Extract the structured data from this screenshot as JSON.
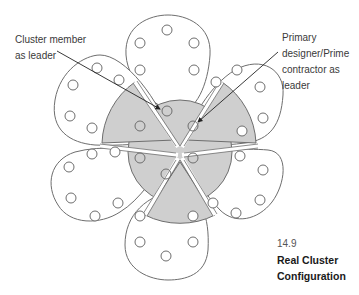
{
  "figure": {
    "number": "14.9",
    "title_line1": "Real Cluster",
    "title_line2": "Configuration"
  },
  "annotations": {
    "left": {
      "line1": "Cluster member",
      "line2": "as leader"
    },
    "right": {
      "line1": "Primary",
      "line2": "designer/Prime",
      "line3": "contractor as",
      "line4": "leader"
    }
  },
  "colors": {
    "stroke": "#6e6e6e",
    "shade": "#cfcfcf",
    "background": "#ffffff",
    "text": "#3a3a3a"
  },
  "diagram": {
    "center": [
      180,
      150
    ],
    "core_radius": 52,
    "petal_count": 6,
    "shaded_sectors": [
      "top-left",
      "top-right",
      "bottom"
    ],
    "members_per_petal": 6
  }
}
